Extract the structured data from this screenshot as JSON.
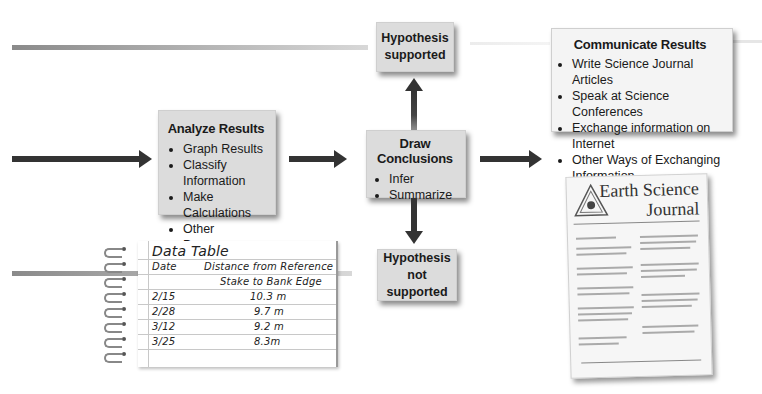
{
  "analyze": {
    "title": "Analyze Results",
    "items": [
      "Graph Results",
      "Classify Information",
      "Make Calculations",
      "Other Processes"
    ]
  },
  "conclusions": {
    "title": "Draw Conclusions",
    "items": [
      "Infer",
      "Summarize"
    ]
  },
  "hypothesis_supported": {
    "line1": "Hypothesis",
    "line2": "supported"
  },
  "hypothesis_not_supported": {
    "line1": "Hypothesis not",
    "line2": "supported"
  },
  "communicate": {
    "title": "Communicate Results",
    "items": [
      "Write Science Journal Articles",
      "Speak at Science Conferences",
      "Exchange information on Internet",
      "Other Ways of Exchanging Information"
    ]
  },
  "data_table": {
    "title": "Data Table",
    "col_date": "Date",
    "col_distance_1": "Distance from Reference",
    "col_distance_2": "Stake to Bank Edge",
    "rows": [
      {
        "date": "2/15",
        "distance": "10.3 m"
      },
      {
        "date": "2/28",
        "distance": "9.7 m"
      },
      {
        "date": "3/12",
        "distance": "9.2 m"
      },
      {
        "date": "3/25",
        "distance": "8.3m"
      }
    ]
  },
  "journal": {
    "title_line1": "Earth Science",
    "title_line2": "Journal"
  },
  "colors": {
    "box_fill": "#dcdcdc",
    "arrow": "#333333"
  }
}
